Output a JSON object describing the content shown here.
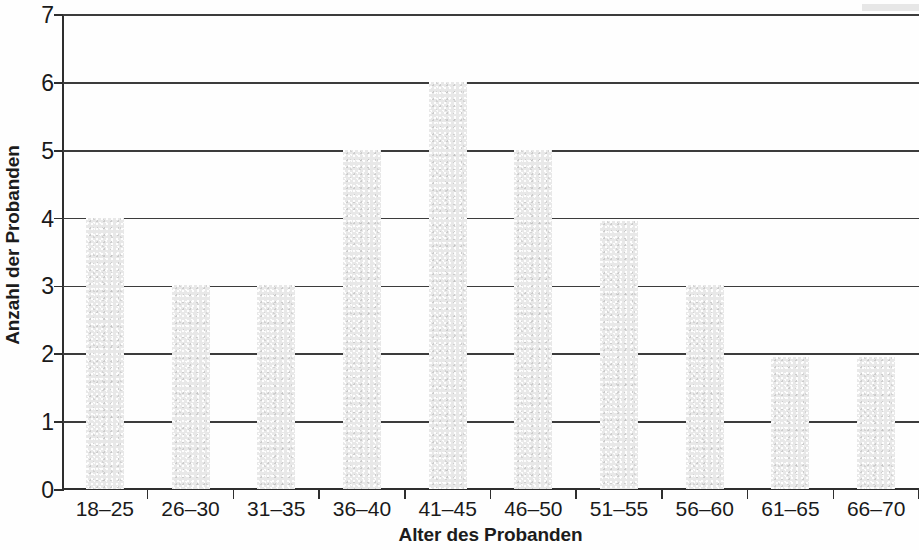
{
  "chart_data": {
    "type": "bar",
    "title": "",
    "subtitle": "",
    "xlabel": "Alter des Probanden",
    "ylabel": "Anzahl der Probanden",
    "categories": [
      "18–25",
      "26–30",
      "31–35",
      "36–40",
      "41–45",
      "46–50",
      "51–55",
      "56–60",
      "61–65",
      "66–70"
    ],
    "values": [
      4,
      3,
      3,
      5,
      6,
      5,
      3.95,
      3,
      1.95,
      1.95
    ],
    "ylim": [
      0,
      7
    ],
    "ytick_labels": [
      "0",
      "1",
      "2",
      "3",
      "4",
      "5",
      "6",
      "7"
    ],
    "ytick_values": [
      0,
      1,
      2,
      3,
      4,
      5,
      6,
      7
    ],
    "grid": true,
    "grid_axis": "y",
    "legend": false,
    "legend_position": "none",
    "bar_color": "#e8e8e8",
    "grid_color": "#3c3c3c",
    "axis_color": "#2e2e2e",
    "text_color": "#1a1a1a"
  },
  "axes": {
    "y_title": "Anzahl der Probanden",
    "x_title": "Alter des Probanden"
  }
}
